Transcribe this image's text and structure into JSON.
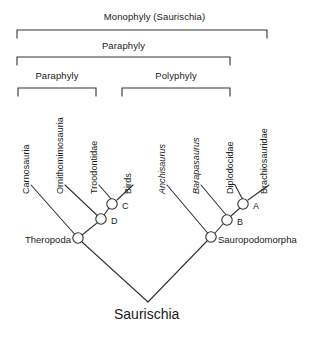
{
  "figure": {
    "title_brackets": [
      {
        "label": "Monophyly  (Saurischia)",
        "x1": 17,
        "x2": 267,
        "y": 30,
        "label_y": 12,
        "name": "bracket-monophyly"
      },
      {
        "label": "Paraphyly",
        "x1": 17,
        "x2": 230,
        "y": 57,
        "label_y": 40,
        "name": "bracket-paraphyly-outer"
      },
      {
        "label": "Paraphyly",
        "x1": 18,
        "x2": 96,
        "y": 88,
        "label_y": 70,
        "name": "bracket-paraphyly-inner"
      },
      {
        "label": "Polyphyly",
        "x1": 122,
        "x2": 230,
        "y": 88,
        "label_y": 70,
        "name": "bracket-polyphyly"
      }
    ],
    "tips": [
      {
        "label": "Carnosauria",
        "italic": false,
        "x": 31,
        "y": 184,
        "name": "tip-carnosauria"
      },
      {
        "label": "Ornithomimosauria",
        "italic": false,
        "x": 65,
        "y": 184,
        "name": "tip-ornithomimosauria"
      },
      {
        "label": "Troodontidae",
        "italic": false,
        "x": 99,
        "y": 184,
        "name": "tip-troodontidae"
      },
      {
        "label": "Birds",
        "italic": false,
        "x": 133,
        "y": 184,
        "name": "tip-birds"
      },
      {
        "label": "Anchisaurus",
        "italic": true,
        "x": 167,
        "y": 184,
        "name": "tip-anchisaurus"
      },
      {
        "label": "Barapasaurus",
        "italic": true,
        "x": 201,
        "y": 184,
        "name": "tip-barapasaurus"
      },
      {
        "label": "Diplodocidae",
        "italic": false,
        "x": 235,
        "y": 184,
        "name": "tip-diplodocidae"
      },
      {
        "label": "Brachiosauridae",
        "italic": false,
        "x": 269,
        "y": 184,
        "name": "tip-brachiosauridae"
      }
    ],
    "nodes": [
      {
        "label": "C",
        "cx": 112,
        "cy": 204,
        "lx": 123,
        "ly": 205,
        "name": "node-c"
      },
      {
        "label": "D",
        "cx": 101,
        "cy": 219,
        "lx": 112,
        "ly": 220,
        "name": "node-d"
      },
      {
        "label": "A",
        "cx": 243,
        "cy": 204,
        "lx": 254,
        "ly": 205,
        "name": "node-a"
      },
      {
        "label": "B",
        "cx": 227,
        "cy": 220,
        "lx": 238,
        "ly": 221,
        "name": "node-b"
      }
    ],
    "clades": [
      {
        "label": "Theropoda",
        "cx": 78,
        "cy": 238,
        "lx": 26,
        "ly": 241,
        "name": "clade-theropoda"
      },
      {
        "label": "Sauropodomorpha",
        "cx": 211,
        "cy": 237,
        "lx": 218,
        "ly": 240,
        "name": "clade-sauropodomorpha"
      }
    ],
    "root": {
      "label": "Saurischia",
      "x": 118,
      "y": 309,
      "apex_x": 148,
      "apex_y": 302,
      "name": "root-saurischia"
    },
    "colors": {
      "ink": "#1a1a1a",
      "line": "#333333",
      "background": "#ffffff"
    }
  }
}
